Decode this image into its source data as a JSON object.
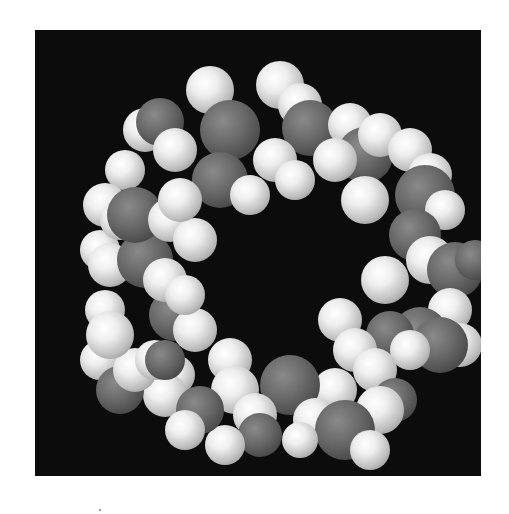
{
  "figure": {
    "background_color": "#0c0c0c",
    "atom_colors": {
      "dark": "#5a5a5a",
      "light": "#eeeeee"
    }
  }
}
